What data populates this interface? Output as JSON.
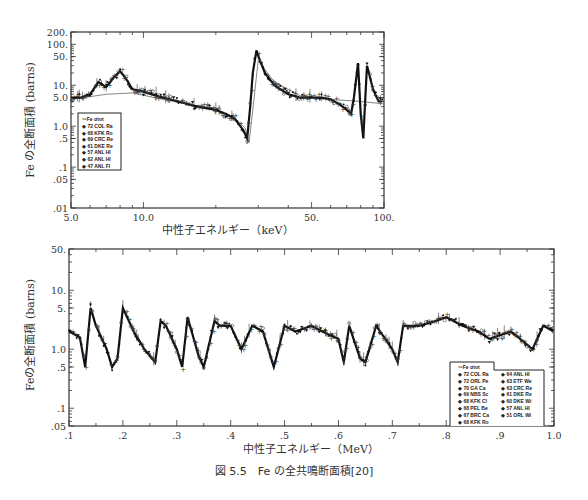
{
  "caption": "図 5.5　Fe の全共鳴断面積[20]",
  "chart_data": [
    {
      "type": "scatter",
      "title": "",
      "xlabel": "中性子エネルギー（keV）",
      "ylabel": "Fe の全断面積 (barns)",
      "xscale": "log",
      "yscale": "log",
      "xlim": [
        5.0,
        100.0
      ],
      "ylim": [
        0.01,
        200
      ],
      "xticks": [
        "5.0",
        "10.0",
        "50.",
        "100."
      ],
      "yticks": [
        "200.",
        "100.",
        "50.",
        "10.",
        "5.0",
        "1.0",
        ".5",
        ".1",
        ".05",
        ".01"
      ],
      "grid": false,
      "legend_position": "lower left",
      "legend": {
        "title": "56Fe σtot",
        "entries": [
          "72 COL Ra",
          "68 KFK Ro",
          "69 CRC Re",
          "61 DKE Re",
          "57 ANL HI",
          "62 ANL HI",
          "47 ANL FI"
        ],
        "markers": [
          "triangle",
          "tri-down-bar",
          "plus",
          "triangle-down",
          "star",
          "circle-dot",
          "filled-circle"
        ]
      },
      "x": [
        5.0,
        5.5,
        6.0,
        6.5,
        7.0,
        7.5,
        8.0,
        8.5,
        9.0,
        10.0,
        12.0,
        14.0,
        16.0,
        18.0,
        20.0,
        22.0,
        24.0,
        26.0,
        27.0,
        27.8,
        28.5,
        29.5,
        30.5,
        32.0,
        35.0,
        40.0,
        45.0,
        50.0,
        55.0,
        60.0,
        65.0,
        70.0,
        73.0,
        75.0,
        78.0,
        80.0,
        82.0,
        85.0,
        90.0,
        95.0,
        100.0
      ],
      "y": [
        5.0,
        5.0,
        6.0,
        12.0,
        9.0,
        15.0,
        22.0,
        14.0,
        8.0,
        7.0,
        5.0,
        4.0,
        3.2,
        2.8,
        2.5,
        2.0,
        1.5,
        0.8,
        0.5,
        3.0,
        20.0,
        70.0,
        40.0,
        20.0,
        10.0,
        6.0,
        5.0,
        5.0,
        5.0,
        4.5,
        3.5,
        2.5,
        2.0,
        5.0,
        35.0,
        2.0,
        0.5,
        30.0,
        8.0,
        4.0,
        4.0
      ],
      "annotations": [
        "Resonance peak ~28 keV (~70 b)",
        "Minimum ~27.5 keV (~0.5 b)",
        "Outliers 0.03–0.05 b near 27–28 keV",
        "Deep minimum ~82 keV, points to ~0.01 b"
      ]
    },
    {
      "type": "scatter",
      "title": "",
      "xlabel": "中性子エネルギー（MeV）",
      "ylabel": "Feの全断面積 (barns)",
      "xscale": "linear",
      "yscale": "log",
      "xlim": [
        0.1,
        1.0
      ],
      "ylim": [
        0.05,
        50
      ],
      "xticks": [
        ".1",
        ".2",
        ".3",
        ".4",
        ".5",
        ".6",
        ".7",
        ".8",
        ".9",
        "1.0"
      ],
      "yticks": [
        "50.",
        "10.",
        "5.",
        "1.0",
        ".5",
        ".1",
        ".05"
      ],
      "grid": false,
      "legend_position": "lower right",
      "legend": {
        "title": "56Fe σtot",
        "entries": [
          "72 COL Ra",
          "72 ORL Pe",
          "70 GA Ca",
          "69 NBS Sc",
          "68 KFK Cl",
          "68 PEL Be",
          "67 BRC Ca",
          "68 KFK Ro",
          "64 ANL HI",
          "63 ETF We",
          "63 CRC Re",
          "61 DKE Re",
          "60 DKE Wi",
          "57 ANL HI",
          "51 ORL Wi"
        ],
        "markers": [
          "triangle",
          "square",
          "circle-dot",
          "circle",
          "filled-triangle",
          "plus",
          "star",
          "triangle-down",
          "x",
          "triangle-up-sm",
          "plus-thick",
          "tri-down",
          "x-small",
          "star-small",
          "circle-plus"
        ]
      },
      "x": [
        0.1,
        0.12,
        0.13,
        0.14,
        0.15,
        0.17,
        0.18,
        0.19,
        0.2,
        0.22,
        0.24,
        0.26,
        0.27,
        0.28,
        0.3,
        0.31,
        0.32,
        0.34,
        0.35,
        0.37,
        0.38,
        0.4,
        0.42,
        0.44,
        0.46,
        0.48,
        0.5,
        0.52,
        0.55,
        0.57,
        0.6,
        0.61,
        0.62,
        0.64,
        0.65,
        0.67,
        0.7,
        0.71,
        0.72,
        0.75,
        0.78,
        0.8,
        0.83,
        0.86,
        0.88,
        0.92,
        0.95,
        0.96,
        0.98,
        1.0
      ],
      "y": [
        2.0,
        1.6,
        0.5,
        5.0,
        2.5,
        1.0,
        0.5,
        0.7,
        5.0,
        2.0,
        1.0,
        0.6,
        3.0,
        2.5,
        1.0,
        0.5,
        3.5,
        0.8,
        0.5,
        3.0,
        2.5,
        2.5,
        1.0,
        2.5,
        2.0,
        0.5,
        2.5,
        2.0,
        2.5,
        2.0,
        1.5,
        0.6,
        2.5,
        0.7,
        0.6,
        2.5,
        1.0,
        0.6,
        2.5,
        2.5,
        3.0,
        3.5,
        2.5,
        2.0,
        1.5,
        2.0,
        1.2,
        1.0,
        2.5,
        2.0
      ],
      "annotations": [
        "Dense resonance structure, cross section ~0.4–8 b"
      ]
    }
  ]
}
